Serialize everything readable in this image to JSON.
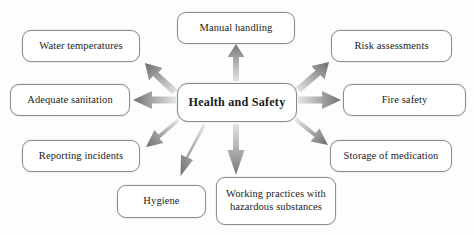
{
  "diagram": {
    "type": "spider-mind-map",
    "title": "Health and Safety",
    "background_color": "#fdfdfc",
    "box_border_color": "#8d8d8d",
    "box_fill_color": "#ffffff",
    "text_color": "#1b1b1b",
    "arrow_color_dark": "#6f6f6f",
    "arrow_color_light": "#d9d9d9",
    "center": {
      "label": "Health and Safety",
      "x": 177,
      "y": 83,
      "width": 120,
      "height": 39
    },
    "branches": [
      {
        "id": "manual-handling",
        "label": "Manual handling",
        "direction": "up",
        "x": 177,
        "y": 12,
        "width": 118,
        "height": 32
      },
      {
        "id": "risk-assessments",
        "label": "Risk assessments",
        "direction": "up-right",
        "x": 331,
        "y": 30,
        "width": 121,
        "height": 32
      },
      {
        "id": "fire-safety",
        "label": "Fire safety",
        "direction": "right",
        "x": 343,
        "y": 84,
        "width": 123,
        "height": 32
      },
      {
        "id": "storage-of-medication",
        "label": "Storage of medication",
        "direction": "down-right",
        "x": 330,
        "y": 140,
        "width": 122,
        "height": 32
      },
      {
        "id": "working-practices-hazardous-substances",
        "label": "Working practices with\nhazardous substances",
        "direction": "down",
        "x": 216,
        "y": 177,
        "width": 120,
        "height": 48
      },
      {
        "id": "hygiene",
        "label": "Hygiene",
        "direction": "down-left",
        "x": 117,
        "y": 185,
        "width": 89,
        "height": 33
      },
      {
        "id": "reporting-incidents",
        "label": "Reporting incidents",
        "direction": "left-down",
        "x": 22,
        "y": 140,
        "width": 118,
        "height": 32
      },
      {
        "id": "adequate-sanitation",
        "label": "Adequate sanitation",
        "direction": "left",
        "x": 10,
        "y": 84,
        "width": 120,
        "height": 32
      },
      {
        "id": "water-temperatures",
        "label": "Water temperatures",
        "direction": "up-left",
        "x": 22,
        "y": 30,
        "width": 118,
        "height": 32
      }
    ]
  }
}
